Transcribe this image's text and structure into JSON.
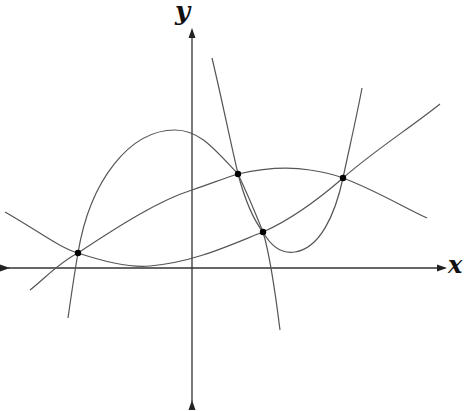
{
  "axes": {
    "x_label": "x",
    "y_label": "y",
    "origin": [
      192,
      268
    ],
    "x_axis": {
      "from": [
        8,
        268
      ],
      "to": [
        445,
        268
      ],
      "bidirectional": true
    },
    "y_axis": {
      "from": [
        192,
        402
      ],
      "to": [
        192,
        30
      ],
      "bidirectional": true
    }
  },
  "colors": {
    "axis": "#333333",
    "curve": "#555555",
    "point": "#000000",
    "background": "#ffffff"
  },
  "curves": [
    {
      "name": "upward-curve",
      "path": "M 5 212 C 40 232, 60 248, 78 253 C 105 262, 130 268, 150 266 C 195 262, 230 245, 263 232 C 290 220, 320 198, 343 178 C 375 150, 410 128, 440 104"
    },
    {
      "name": "concave-down-curve",
      "path": "M 30 290 C 45 278, 60 262, 78 253 C 120 225, 160 200, 192 190 C 210 184, 225 178, 238 174 C 260 169, 285 166, 310 170 C 325 172, 335 175, 343 178 C 375 190, 405 208, 427 218"
    },
    {
      "name": "cubic-curve",
      "path": "M 68 318 C 72 290, 75 270, 78 253 C 90 180, 130 130, 175 130 C 200 130, 215 150, 238 174 C 248 195, 255 212, 263 232 C 270 255, 275 290, 280 330"
    },
    {
      "name": "steep-curve",
      "path": "M 212 58 C 222 100, 230 140, 238 174 C 245 200, 252 218, 263 232 C 272 248, 282 254, 295 252 C 320 248, 335 215, 343 178 C 350 145, 357 115, 362 88"
    }
  ],
  "points": [
    {
      "name": "intersection-point-1",
      "x": 78,
      "y": 253
    },
    {
      "name": "intersection-point-2",
      "x": 238,
      "y": 174
    },
    {
      "name": "intersection-point-3",
      "x": 263,
      "y": 232
    },
    {
      "name": "intersection-point-4",
      "x": 343,
      "y": 178
    }
  ]
}
